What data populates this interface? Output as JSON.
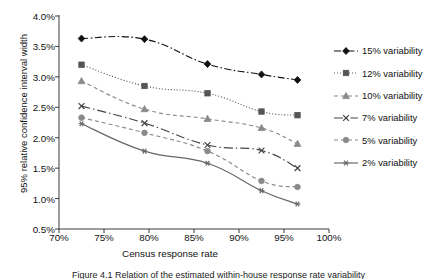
{
  "chart_data": {
    "type": "line",
    "title": "",
    "xlabel": "Census response rate",
    "ylabel": "95% relative confidence interval width",
    "xlim": [
      70,
      100
    ],
    "ylim": [
      0.5,
      4.0
    ],
    "xticks": [
      "70%",
      "75%",
      "80%",
      "85%",
      "90%",
      "95%",
      "100%"
    ],
    "xtick_values": [
      70,
      75,
      80,
      85,
      90,
      95,
      100
    ],
    "yticks": [
      "0.5%",
      "1.0%",
      "1.5%",
      "2.0%",
      "2.5%",
      "3.0%",
      "3.5%",
      "4.0%"
    ],
    "ytick_values": [
      0.5,
      1.0,
      1.5,
      2.0,
      2.5,
      3.0,
      3.5,
      4.0
    ],
    "grid": false,
    "legend_position": "right",
    "x": [
      72.5,
      79.5,
      86.5,
      92.5,
      96.5
    ],
    "series": [
      {
        "name": "15% variability",
        "marker": "diamond",
        "linestyle": "dash-dot",
        "color": "#111111",
        "values": [
          3.63,
          3.62,
          3.21,
          3.04,
          2.95
        ]
      },
      {
        "name": "12% variability",
        "marker": "square",
        "linestyle": "dotted",
        "color": "#555555",
        "values": [
          3.2,
          2.85,
          2.73,
          2.43,
          2.37
        ]
      },
      {
        "name": "10% variability",
        "marker": "triangle",
        "linestyle": "dashed",
        "color": "#8a8a8a",
        "values": [
          2.93,
          2.47,
          2.31,
          2.16,
          1.9
        ]
      },
      {
        "name": "7% variability",
        "marker": "x",
        "linestyle": "long-dash-dot",
        "color": "#444444",
        "values": [
          2.52,
          2.24,
          1.88,
          1.79,
          1.5
        ]
      },
      {
        "name": "5% variability",
        "marker": "circle",
        "linestyle": "dashed",
        "color": "#8a8a8a",
        "values": [
          2.33,
          2.08,
          1.78,
          1.29,
          1.19
        ]
      },
      {
        "name": "2% variability",
        "marker": "asterisk",
        "linestyle": "solid",
        "color": "#666666",
        "values": [
          2.23,
          1.78,
          1.58,
          1.13,
          0.91
        ]
      }
    ]
  },
  "legend": {
    "items": [
      {
        "label": "15% variability"
      },
      {
        "label": "12% variability"
      },
      {
        "label": "10% variability"
      },
      {
        "label": "7% variability"
      },
      {
        "label": "5% variability"
      },
      {
        "label": "2% variability"
      }
    ]
  },
  "caption": {
    "text": "Figure 4.1   Relation of  the estimated within-house response rate variability"
  }
}
